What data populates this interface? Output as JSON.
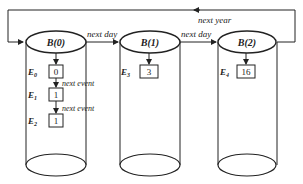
{
  "diagram": {
    "loop_label": "next year",
    "buckets": [
      {
        "label": "B(0)",
        "events": [
          {
            "label": "E",
            "sub": "0",
            "value": "0"
          },
          {
            "label": "E",
            "sub": "1",
            "value": "1"
          },
          {
            "label": "E",
            "sub": "2",
            "value": "1"
          }
        ]
      },
      {
        "label": "B(1)",
        "events": [
          {
            "label": "E",
            "sub": "3",
            "value": "3"
          }
        ]
      },
      {
        "label": "B(2)",
        "events": [
          {
            "label": "E",
            "sub": "4",
            "value": "16"
          }
        ]
      }
    ],
    "transitions": {
      "b0_to_b1": "next day",
      "b1_to_b2": "next day",
      "e0_to_e1": "next event",
      "e1_to_e2": "next event"
    },
    "colors": {
      "stroke": "#222222",
      "background": "#ffffff"
    }
  }
}
